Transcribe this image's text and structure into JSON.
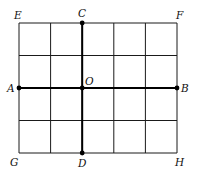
{
  "diagram": {
    "type": "grid-figure",
    "grid": {
      "columns": 5,
      "rows": 4,
      "x_lines": [
        19,
        50.6,
        82.2,
        113.8,
        145.4,
        177
      ],
      "y_lines": [
        23,
        55.5,
        88,
        120.5,
        153
      ],
      "color": "#1a1a1a"
    },
    "segments": [
      {
        "id": "AB",
        "from": "A",
        "to": "B",
        "bold": true
      },
      {
        "id": "CD",
        "from": "C",
        "to": "D",
        "bold": true
      }
    ],
    "points": [
      {
        "id": "A",
        "label": "A",
        "x": 19,
        "y": 88,
        "dot": true,
        "lx": 7,
        "ly": 92
      },
      {
        "id": "B",
        "label": "B",
        "x": 177,
        "y": 88,
        "dot": true,
        "lx": 181,
        "ly": 92
      },
      {
        "id": "C",
        "label": "C",
        "x": 82.2,
        "y": 23,
        "dot": true,
        "lx": 78,
        "ly": 17
      },
      {
        "id": "D",
        "label": "D",
        "x": 82.2,
        "y": 153,
        "dot": true,
        "lx": 78,
        "ly": 167
      },
      {
        "id": "O",
        "label": "O",
        "x": 82.2,
        "y": 88,
        "dot": true,
        "lx": 85,
        "ly": 85
      },
      {
        "id": "E",
        "label": "E",
        "x": 19,
        "y": 23,
        "dot": false,
        "lx": 14,
        "ly": 19
      },
      {
        "id": "F",
        "label": "F",
        "x": 177,
        "y": 23,
        "dot": false,
        "lx": 176,
        "ly": 19
      },
      {
        "id": "G",
        "label": "G",
        "x": 19,
        "y": 153,
        "dot": false,
        "lx": 10,
        "ly": 166
      },
      {
        "id": "H",
        "label": "H",
        "x": 177,
        "y": 153,
        "dot": false,
        "lx": 175,
        "ly": 166
      }
    ]
  }
}
